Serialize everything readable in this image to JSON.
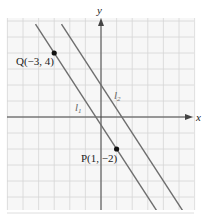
{
  "figure": {
    "axes": {
      "x_label": "x",
      "y_label": "y"
    },
    "grid": {
      "x_min": -6,
      "x_max": 6,
      "y_min": -6,
      "y_max": 6,
      "step": 1
    },
    "points": [
      {
        "name": "Q",
        "label": "Q(−3, 4)",
        "x": -3,
        "y": 4
      },
      {
        "name": "P",
        "label": "P(1, −2)",
        "x": 1,
        "y": -2
      }
    ],
    "lines": [
      {
        "name": "l1",
        "letter": "l",
        "sub": "1",
        "slope": -1.5,
        "intercept": -0.5
      },
      {
        "name": "l2",
        "letter": "l",
        "sub": "2",
        "slope": -1.5,
        "intercept": 2
      }
    ],
    "colors": {
      "grid": "#d6d6d6",
      "axis": "#444444",
      "line": "#6e6e6e",
      "point": "#111111",
      "background": "#f7f7f7"
    }
  }
}
